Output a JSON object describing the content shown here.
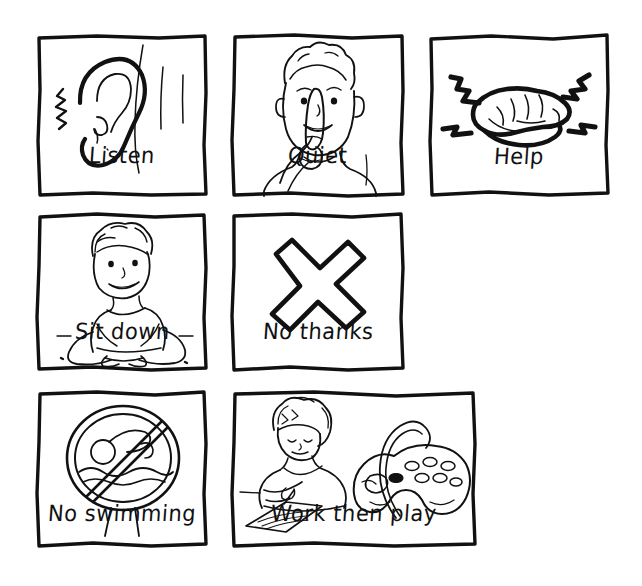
{
  "sheet": {
    "title": "Picture communication cards",
    "background_color": "#ffffff",
    "ink_color": "#111111",
    "style": "hand-drawn black ink line art, white background",
    "rows": 3,
    "columns": [
      3,
      2,
      2
    ]
  },
  "cards": [
    {
      "id": "listen",
      "label": "Listen",
      "icon": "ear-icon",
      "description": "A large ear on the side of a head with sound lines",
      "row": 1,
      "column": 1,
      "x": 35,
      "y": 33,
      "width": 174,
      "height": 165
    },
    {
      "id": "quiet",
      "label": "Quiet",
      "icon": "finger-to-lips-icon",
      "description": "A smiling child holding one finger in front of the lips",
      "row": 1,
      "column": 2,
      "x": 230,
      "y": 33,
      "width": 176,
      "height": 165
    },
    {
      "id": "help",
      "label": "Help",
      "icon": "handshake-icon",
      "description": "Two hands clasped together in a handshake",
      "row": 1,
      "column": 3,
      "x": 427,
      "y": 33,
      "width": 184,
      "height": 165
    },
    {
      "id": "sit-down",
      "label": "Sit down",
      "icon": "child-sitting-icon",
      "description": "A child sitting cross-legged on the floor",
      "row": 2,
      "column": 1,
      "x": 35,
      "y": 212,
      "width": 174,
      "height": 160
    },
    {
      "id": "no-thanks",
      "label": "No thanks",
      "icon": "cross-x-icon",
      "description": "A large bold X cross shape",
      "row": 2,
      "column": 2,
      "x": 230,
      "y": 212,
      "width": 176,
      "height": 160
    },
    {
      "id": "no-swimming",
      "label": "No swimming",
      "icon": "no-swimming-sign-icon",
      "description": "A circular prohibition sign with a swimmer crossed out, on a signpost",
      "row": 3,
      "column": 1,
      "x": 35,
      "y": 390,
      "width": 174,
      "height": 158
    },
    {
      "id": "work-then-play",
      "label": "Work then play",
      "icon": "writing-child-and-gamepad-icon",
      "description": "A child writing at a desk next to a video game controller",
      "row": 3,
      "column": 2,
      "x": 230,
      "y": 390,
      "width": 248,
      "height": 158
    }
  ]
}
